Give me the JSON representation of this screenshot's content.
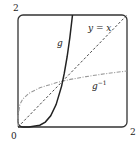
{
  "chart_data": {
    "type": "line",
    "title": "",
    "xlabel": "",
    "ylabel": "",
    "xlim": [
      0,
      2
    ],
    "ylim": [
      0,
      2
    ],
    "grid": false,
    "tick_labels": {
      "origin": "0",
      "x_max": "2",
      "y_max": "2"
    },
    "series": [
      {
        "name": "g",
        "style": "solid",
        "x": [
          0,
          0.2,
          0.4,
          0.5,
          0.6,
          0.7,
          0.8,
          0.85,
          0.9,
          0.95,
          1.0
        ],
        "y": [
          0,
          0.0014,
          0.033,
          0.088,
          0.2,
          0.4,
          0.73,
          0.96,
          1.25,
          1.59,
          2.0
        ]
      },
      {
        "name": "y = x",
        "style": "dashed",
        "x": [
          0,
          2
        ],
        "y": [
          0,
          2
        ]
      },
      {
        "name": "g^-1",
        "style": "dash-dot",
        "x": [
          0,
          0.0014,
          0.033,
          0.088,
          0.2,
          0.4,
          0.73,
          0.96,
          1.25,
          1.59,
          2.0
        ],
        "y": [
          0,
          0.2,
          0.4,
          0.5,
          0.6,
          0.7,
          0.8,
          0.85,
          0.9,
          0.95,
          1.0
        ]
      }
    ],
    "annotations": [
      {
        "text": "g",
        "x": 0.75,
        "y": 1.48
      },
      {
        "text": "y = x",
        "x": 1.3,
        "y": 1.75
      },
      {
        "text": "g",
        "superscript": "−1",
        "x": 1.37,
        "y": 0.72
      }
    ]
  },
  "labels": {
    "y_max": "2",
    "x_max": "2",
    "origin": "0",
    "g": "g",
    "identity": "y = x",
    "ginv_base": "g",
    "ginv_sup": "−1"
  }
}
